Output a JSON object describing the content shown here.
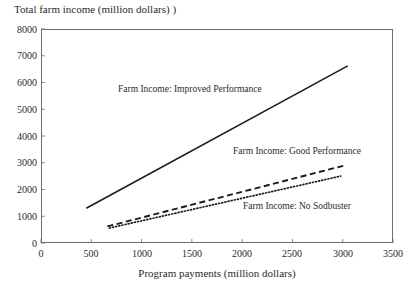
{
  "chart_data": {
    "type": "line",
    "title": "Total farm income (million dollars) )",
    "xlabel": "Program payments (million dollars)",
    "ylabel": "",
    "xlim": [
      0,
      3500
    ],
    "ylim": [
      0,
      8000
    ],
    "xticks": [
      "0",
      "500",
      "1000",
      "1500",
      "2000",
      "2500",
      "3000",
      "3500"
    ],
    "yticks": [
      "0",
      "1000",
      "2000",
      "3000",
      "4000",
      "5000",
      "6000",
      "7000",
      "8000"
    ],
    "grid": false,
    "legend_position": "inline-annotations",
    "series": [
      {
        "name": "Farm Income: Improved Performance",
        "style": "solid",
        "color": "#1a1a1a",
        "x": [
          450,
          3050
        ],
        "values": [
          1300,
          6620
        ]
      },
      {
        "name": "Farm Income: Good Performance",
        "style": "dashed",
        "color": "#1a1a1a",
        "x": [
          660,
          3010
        ],
        "values": [
          620,
          2890
        ]
      },
      {
        "name": "Farm Income: No Sodbuster",
        "style": "dotted",
        "color": "#1a1a1a",
        "x": [
          680,
          2980
        ],
        "values": [
          560,
          2500
        ]
      }
    ],
    "annotations": [
      {
        "text": "Farm Income: Improved Performance",
        "x_px": 118,
        "y_px": 84
      },
      {
        "text": "Farm Income: Good Performance",
        "x_px": 233,
        "y_px": 146
      },
      {
        "text": "Farm Income: No Sodbuster",
        "x_px": 243,
        "y_px": 201
      }
    ]
  },
  "axes": {
    "y_tick_labels": [
      {
        "label": "8000",
        "top": 25
      },
      {
        "label": "7000",
        "top": 51
      },
      {
        "label": "6000",
        "top": 78
      },
      {
        "label": "5000",
        "top": 105
      },
      {
        "label": "4000",
        "top": 132
      },
      {
        "label": "3000",
        "top": 158
      },
      {
        "label": "2000",
        "top": 185
      },
      {
        "label": "1000",
        "top": 212
      },
      {
        "label": "0",
        "top": 239
      }
    ],
    "x_tick_labels": [
      {
        "label": "0",
        "left": 41
      },
      {
        "label": "500",
        "left": 91
      },
      {
        "label": "1000",
        "left": 142
      },
      {
        "label": "1500",
        "left": 192
      },
      {
        "label": "2000",
        "left": 242
      },
      {
        "label": "2500",
        "left": 292
      },
      {
        "label": "3000",
        "left": 343
      },
      {
        "label": "3500",
        "left": 393
      }
    ]
  }
}
